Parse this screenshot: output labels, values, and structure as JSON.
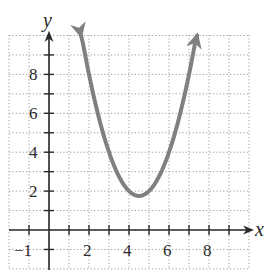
{
  "chart_data": {
    "type": "line",
    "title": "",
    "xlabel": "x",
    "ylabel": "y",
    "xlim": [
      -2,
      10
    ],
    "ylim": [
      -2,
      10
    ],
    "grid": true,
    "grid_style": "dotted",
    "x_ticks": [
      -1,
      0,
      1,
      2,
      3,
      4,
      5,
      6,
      7,
      8,
      9
    ],
    "x_tick_labels": [
      "-1",
      "2",
      "4",
      "6",
      "8"
    ],
    "x_tick_label_values": [
      -1,
      2,
      4,
      6,
      8
    ],
    "y_ticks": [
      1,
      2,
      3,
      4,
      5,
      6,
      7,
      8,
      9
    ],
    "y_tick_labels": [
      "2",
      "4",
      "6",
      "8"
    ],
    "y_tick_label_values": [
      2,
      4,
      6,
      8
    ],
    "series": [
      {
        "name": "parabola",
        "equation": "y = x^2 - 9x + 22",
        "vertex": [
          4.5,
          1.75
        ],
        "color": "#808080",
        "arrows_both_ends": true,
        "x": [
          1.6,
          2,
          2.5,
          3,
          3.5,
          4,
          4.5,
          5,
          5.5,
          6,
          6.5,
          7,
          7.4
        ],
        "y": [
          10.0,
          8.0,
          5.75,
          4.0,
          2.75,
          2.0,
          1.75,
          2.0,
          2.75,
          4.0,
          5.75,
          8.0,
          10.0
        ]
      }
    ],
    "legend": null
  },
  "labels": {
    "x_axis": "x",
    "y_axis": "y",
    "x_ticks": {
      "m1": "−1",
      "t2": "2",
      "t4": "4",
      "t6": "6",
      "t8": "8"
    },
    "y_ticks": {
      "t2": "2",
      "t4": "4",
      "t6": "6",
      "t8": "8"
    }
  }
}
